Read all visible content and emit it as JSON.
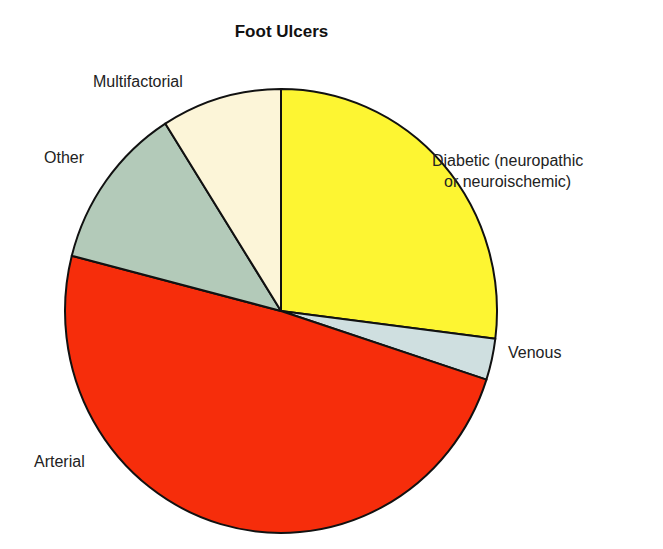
{
  "chart_data": {
    "type": "pie",
    "title": "Foot Ulcers",
    "slices": [
      {
        "label": "Diabetic (neuropathic or neuroischemic)",
        "value": 27,
        "color": "#fdf532"
      },
      {
        "label": "Venous",
        "value": 3,
        "color": "#cfdfe0"
      },
      {
        "label": "Arterial",
        "value": 49,
        "color": "#f62d0b"
      },
      {
        "label": "Other",
        "value": 12,
        "color": "#b3cab9"
      },
      {
        "label": "Multifactorial",
        "value": 9,
        "color": "#fcf5d8"
      }
    ],
    "start_angle_deg": 0,
    "direction": "clockwise",
    "legend": "none (direct labels)"
  },
  "labels": {
    "diabetic_line1": "Diabetic (neuropathic",
    "diabetic_line2": "or neuroischemic)",
    "venous": "Venous",
    "arterial": "Arterial",
    "other": "Other",
    "multifactorial": "Multifactorial"
  }
}
